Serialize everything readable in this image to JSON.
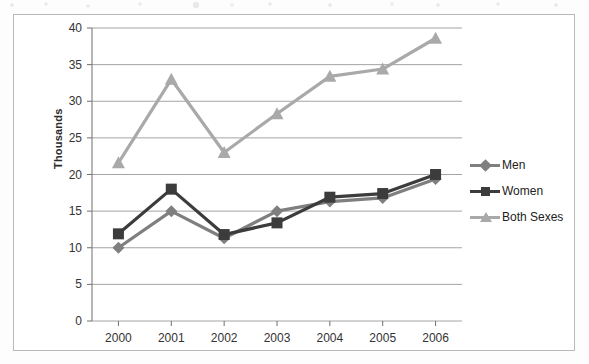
{
  "chart_data": {
    "type": "line",
    "title": "",
    "xlabel": "",
    "ylabel": "Thousands",
    "categories": [
      "2000",
      "2001",
      "2002",
      "2003",
      "2004",
      "2005",
      "2006"
    ],
    "ylim": [
      0,
      40
    ],
    "yticks": [
      "0",
      "5",
      "10",
      "15",
      "20",
      "25",
      "30",
      "35",
      "40"
    ],
    "grid": true,
    "legend_position": "right",
    "series": [
      {
        "name": "Men",
        "color": "#7f7f7f",
        "marker": "diamond",
        "values": [
          10.0,
          15.0,
          11.3,
          15.0,
          16.3,
          16.8,
          19.4
        ]
      },
      {
        "name": "Women",
        "color": "#3c3c3c",
        "marker": "square",
        "values": [
          11.9,
          18.0,
          11.8,
          13.4,
          16.9,
          17.4,
          20.0
        ]
      },
      {
        "name": "Both Sexes",
        "color": "#a9a9a9",
        "marker": "triangle",
        "values": [
          21.6,
          33.0,
          23.0,
          28.3,
          33.4,
          34.4,
          38.6
        ]
      }
    ]
  },
  "axis": {
    "y_label": "Thousands"
  },
  "legend": {
    "items": [
      {
        "label": "Men",
        "color": "#7f7f7f",
        "marker": "diamond"
      },
      {
        "label": "Women",
        "color": "#3c3c3c",
        "marker": "square"
      },
      {
        "label": "Both Sexes",
        "color": "#a9a9a9",
        "marker": "triangle"
      }
    ]
  }
}
